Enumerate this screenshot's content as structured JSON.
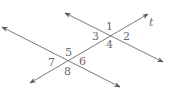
{
  "diagram": {
    "line_color": "#6a6a6a",
    "lines": [
      {
        "name": "upper-line",
        "x1": 65,
        "y1": 13,
        "x2": 163,
        "y2": 62
      },
      {
        "name": "lower-line",
        "x1": 2,
        "y1": 27,
        "x2": 120,
        "y2": 87
      },
      {
        "name": "transversal-t",
        "x1": 30,
        "y1": 83,
        "x2": 148,
        "y2": 14
      }
    ],
    "transversal_label": "t",
    "angle_labels": [
      {
        "id": "1",
        "text": "1",
        "x": 106,
        "y": 30
      },
      {
        "id": "2",
        "text": "2",
        "x": 123,
        "y": 40
      },
      {
        "id": "3",
        "text": "3",
        "x": 92,
        "y": 40
      },
      {
        "id": "4",
        "text": "4",
        "x": 106,
        "y": 48
      },
      {
        "id": "5",
        "text": "5",
        "x": 65,
        "y": 56
      },
      {
        "id": "6",
        "text": "6",
        "x": 79,
        "y": 65
      },
      {
        "id": "7",
        "text": "7",
        "x": 48,
        "y": 66
      },
      {
        "id": "8",
        "text": "8",
        "x": 64,
        "y": 75
      }
    ]
  }
}
